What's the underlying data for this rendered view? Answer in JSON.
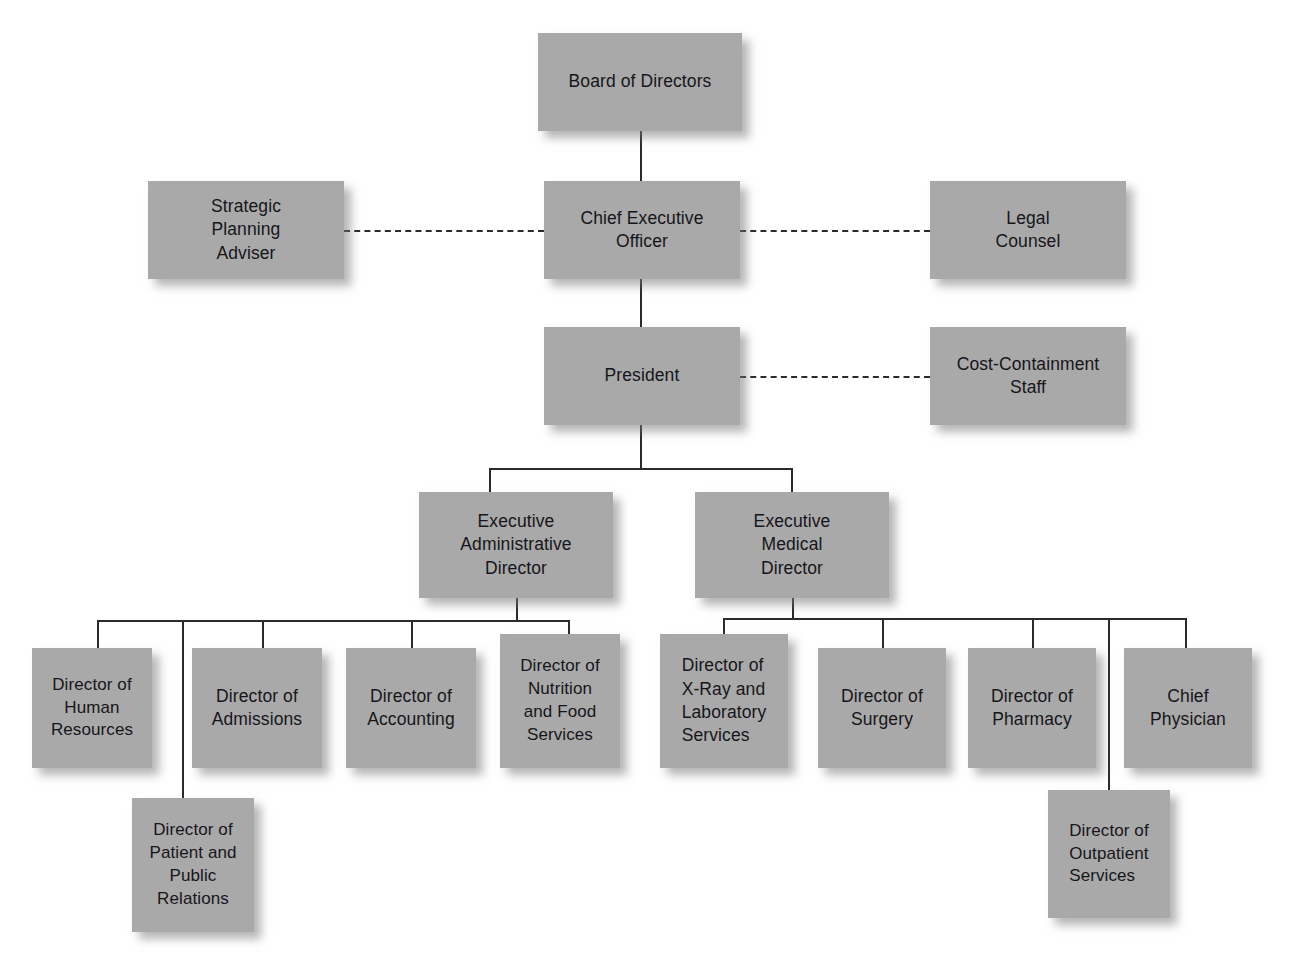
{
  "document": {
    "title": "Hospital Organization Chart",
    "top_caption_partial": ""
  },
  "theme": {
    "background": "#ffffff",
    "node_fill": "#a9a9a9",
    "node_text": "#16161a",
    "connector": "#2b2b2b",
    "shadow": "rgba(120,120,120,0.55)"
  },
  "chart_data": {
    "type": "diagram",
    "diagram_kind": "organization-chart",
    "orientation": "top-down",
    "line_styles": {
      "solid": "reporting line",
      "dashed": "staff / advisory relationship"
    },
    "nodes": [
      {
        "id": "board",
        "label": "Board of Directors",
        "level": 0,
        "x": 538,
        "y": 33,
        "w": 204,
        "h": 98,
        "align": "center"
      },
      {
        "id": "ceo",
        "label": "Chief Executive\nOfficer",
        "level": 1,
        "x": 544,
        "y": 181,
        "w": 196,
        "h": 98,
        "align": "center"
      },
      {
        "id": "spa",
        "label": "Strategic\nPlanning\nAdviser",
        "level": 1,
        "x": 148,
        "y": 181,
        "w": 196,
        "h": 98,
        "align": "center",
        "relation": "staff"
      },
      {
        "id": "legal",
        "label": "Legal\nCounsel",
        "level": 1,
        "x": 930,
        "y": 181,
        "w": 196,
        "h": 98,
        "align": "center",
        "relation": "staff"
      },
      {
        "id": "president",
        "label": "President",
        "level": 2,
        "x": 544,
        "y": 327,
        "w": 196,
        "h": 98,
        "align": "center"
      },
      {
        "id": "cost",
        "label": "Cost-Containment\nStaff",
        "level": 2,
        "x": 930,
        "y": 327,
        "w": 196,
        "h": 98,
        "align": "center",
        "relation": "staff"
      },
      {
        "id": "exec-admin",
        "label": "Executive\nAdministrative\nDirector",
        "level": 3,
        "x": 419,
        "y": 492,
        "w": 194,
        "h": 106,
        "align": "center"
      },
      {
        "id": "exec-med",
        "label": "Executive\nMedical\nDirector",
        "level": 3,
        "x": 695,
        "y": 492,
        "w": 194,
        "h": 106,
        "align": "center"
      },
      {
        "id": "hr",
        "label": "Director of\nHuman\nResources",
        "level": 4,
        "x": 32,
        "y": 648,
        "w": 120,
        "h": 120,
        "align": "center",
        "parent": "exec-admin"
      },
      {
        "id": "admissions",
        "label": "Director of\nAdmissions",
        "level": 4,
        "x": 192,
        "y": 648,
        "w": 130,
        "h": 120,
        "align": "center",
        "parent": "exec-admin"
      },
      {
        "id": "accounting",
        "label": "Director of\nAccounting",
        "level": 4,
        "x": 346,
        "y": 648,
        "w": 130,
        "h": 120,
        "align": "center",
        "parent": "exec-admin"
      },
      {
        "id": "nutrition",
        "label": "Director of\nNutrition\nand Food\nServices",
        "level": 4,
        "x": 500,
        "y": 634,
        "w": 120,
        "h": 134,
        "align": "center",
        "parent": "exec-admin"
      },
      {
        "id": "patient-pr",
        "label": "Director of\nPatient and\nPublic\nRelations",
        "level": 5,
        "x": 132,
        "y": 798,
        "w": 122,
        "h": 134,
        "align": "center",
        "parent": "exec-admin"
      },
      {
        "id": "xray",
        "label": "Director of\nX-Ray and\nLaboratory\nServices",
        "level": 4,
        "x": 660,
        "y": 634,
        "w": 128,
        "h": 134,
        "align": "left",
        "parent": "exec-med"
      },
      {
        "id": "surgery",
        "label": "Director of\nSurgery",
        "level": 4,
        "x": 818,
        "y": 648,
        "w": 128,
        "h": 120,
        "align": "center",
        "parent": "exec-med"
      },
      {
        "id": "pharmacy",
        "label": "Director of\nPharmacy",
        "level": 4,
        "x": 968,
        "y": 648,
        "w": 128,
        "h": 120,
        "align": "center",
        "parent": "exec-med"
      },
      {
        "id": "chief-phys",
        "label": "Chief\nPhysician",
        "level": 4,
        "x": 1124,
        "y": 648,
        "w": 128,
        "h": 120,
        "align": "center",
        "parent": "exec-med"
      },
      {
        "id": "outpatient",
        "label": "Director of\nOutpatient\nServices",
        "level": 5,
        "x": 1048,
        "y": 790,
        "w": 122,
        "h": 128,
        "align": "left",
        "parent": "exec-med"
      }
    ],
    "edges": [
      {
        "from": "board",
        "to": "ceo",
        "style": "solid"
      },
      {
        "from": "ceo",
        "to": "spa",
        "style": "dashed"
      },
      {
        "from": "ceo",
        "to": "legal",
        "style": "dashed"
      },
      {
        "from": "ceo",
        "to": "president",
        "style": "solid"
      },
      {
        "from": "president",
        "to": "cost",
        "style": "dashed"
      },
      {
        "from": "president",
        "to": "exec-admin",
        "style": "solid"
      },
      {
        "from": "president",
        "to": "exec-med",
        "style": "solid"
      },
      {
        "from": "exec-admin",
        "to": "hr",
        "style": "solid"
      },
      {
        "from": "exec-admin",
        "to": "patient-pr",
        "style": "solid"
      },
      {
        "from": "exec-admin",
        "to": "admissions",
        "style": "solid"
      },
      {
        "from": "exec-admin",
        "to": "accounting",
        "style": "solid"
      },
      {
        "from": "exec-admin",
        "to": "nutrition",
        "style": "solid"
      },
      {
        "from": "exec-med",
        "to": "xray",
        "style": "solid"
      },
      {
        "from": "exec-med",
        "to": "surgery",
        "style": "solid"
      },
      {
        "from": "exec-med",
        "to": "pharmacy",
        "style": "solid"
      },
      {
        "from": "exec-med",
        "to": "outpatient",
        "style": "solid"
      },
      {
        "from": "exec-med",
        "to": "chief-phys",
        "style": "solid"
      }
    ]
  },
  "connectors": {
    "solid": [
      {
        "name": "board-to-ceo",
        "o": "v",
        "x": 640,
        "y": 131,
        "len": 50
      },
      {
        "name": "ceo-to-president",
        "o": "v",
        "x": 640,
        "y": 279,
        "len": 48
      },
      {
        "name": "president-stem",
        "o": "v",
        "x": 640,
        "y": 425,
        "len": 43
      },
      {
        "name": "president-bus",
        "o": "h",
        "x": 489,
        "y": 468,
        "len": 303
      },
      {
        "name": "bus-to-exec-admin",
        "o": "v",
        "x": 489,
        "y": 468,
        "len": 24
      },
      {
        "name": "bus-to-exec-med",
        "o": "v",
        "x": 791,
        "y": 468,
        "len": 24
      },
      {
        "name": "exec-admin-stem",
        "o": "v",
        "x": 516,
        "y": 598,
        "len": 22
      },
      {
        "name": "admin-bus",
        "o": "h",
        "x": 97,
        "y": 620,
        "len": 471
      },
      {
        "name": "drop-hr",
        "o": "v",
        "x": 97,
        "y": 620,
        "len": 28
      },
      {
        "name": "drop-patient-pr",
        "o": "v",
        "x": 182,
        "y": 620,
        "len": 178
      },
      {
        "name": "drop-admissions",
        "o": "v",
        "x": 262,
        "y": 620,
        "len": 28
      },
      {
        "name": "drop-accounting",
        "o": "v",
        "x": 411,
        "y": 620,
        "len": 28
      },
      {
        "name": "drop-nutrition",
        "o": "v",
        "x": 568,
        "y": 620,
        "len": 14
      },
      {
        "name": "exec-med-stem",
        "o": "v",
        "x": 792,
        "y": 598,
        "len": 20
      },
      {
        "name": "med-bus",
        "o": "h",
        "x": 723,
        "y": 618,
        "len": 462
      },
      {
        "name": "drop-xray",
        "o": "v",
        "x": 723,
        "y": 618,
        "len": 16
      },
      {
        "name": "drop-surgery",
        "o": "v",
        "x": 882,
        "y": 618,
        "len": 30
      },
      {
        "name": "drop-pharmacy",
        "o": "v",
        "x": 1032,
        "y": 618,
        "len": 30
      },
      {
        "name": "drop-outpatient",
        "o": "v",
        "x": 1108,
        "y": 618,
        "len": 172
      },
      {
        "name": "drop-chief-physician",
        "o": "v",
        "x": 1185,
        "y": 618,
        "len": 30
      }
    ],
    "dashed": [
      {
        "name": "ceo-to-strategic-planning-adviser",
        "x": 344,
        "y": 230,
        "len": 200
      },
      {
        "name": "ceo-to-legal-counsel",
        "x": 740,
        "y": 230,
        "len": 190
      },
      {
        "name": "president-to-cost-containment",
        "x": 740,
        "y": 376,
        "len": 190
      }
    ]
  }
}
